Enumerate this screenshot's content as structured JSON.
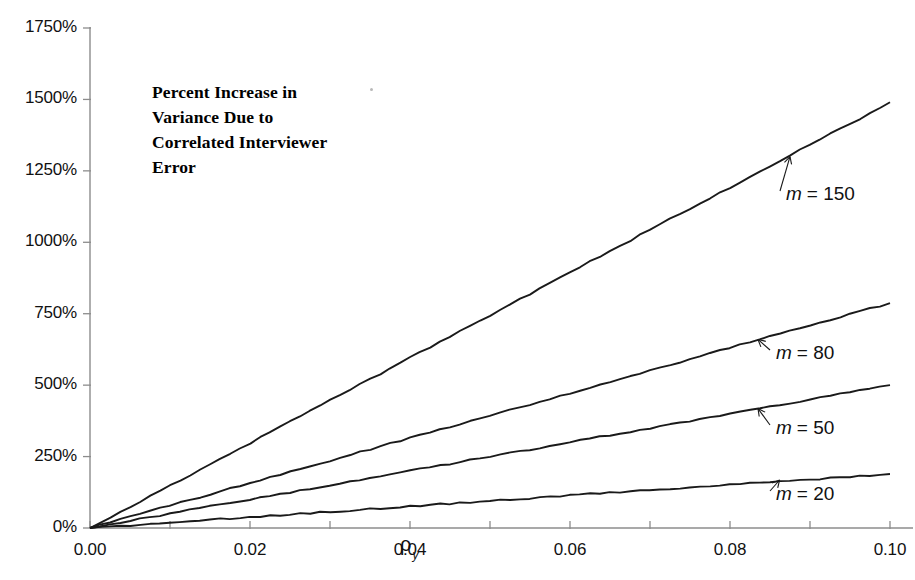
{
  "chart_data": {
    "type": "line",
    "title": "Percent Increase in\nVariance Due to\nCorrelated Interviewer\nError",
    "xlabel": "ρ",
    "xlabel_sub": "y",
    "ylabel": "",
    "xlim": [
      0.0,
      0.1
    ],
    "ylim": [
      0,
      1750
    ],
    "yunit": "%",
    "grid": false,
    "legend_position": "inline-annotations",
    "xticks": [
      0.0,
      0.01,
      0.02,
      0.03,
      0.04,
      0.05,
      0.06,
      0.07,
      0.08,
      0.09,
      0.1
    ],
    "xtick_labels": [
      "0.00",
      "",
      "0.02",
      "",
      "0.04",
      "",
      "0.06",
      "",
      "0.08",
      "",
      "0.10"
    ],
    "yticks": [
      0,
      250,
      500,
      750,
      1000,
      1250,
      1500,
      1750
    ],
    "ytick_labels": [
      "0%",
      "250%",
      "500%",
      "750%",
      "1000%",
      "1250%",
      "1500%",
      "1750%"
    ],
    "x": [
      0.0,
      0.01,
      0.02,
      0.03,
      0.04,
      0.05,
      0.06,
      0.07,
      0.08,
      0.09,
      0.1
    ],
    "series": [
      {
        "name": "m = 150",
        "m": 150,
        "label_math": "m",
        "label_value": "= 150",
        "color": "#1a1a1a",
        "values": [
          0,
          149,
          298,
          447,
          596,
          745,
          894,
          1043,
          1192,
          1341,
          1490
        ]
      },
      {
        "name": "m = 80",
        "m": 80,
        "label_math": "m",
        "label_value": "= 80",
        "color": "#1a1a1a",
        "values": [
          0,
          79,
          157,
          236,
          315,
          394,
          472,
          551,
          630,
          709,
          787
        ]
      },
      {
        "name": "m = 50",
        "m": 50,
        "label_math": "m",
        "label_value": "= 50",
        "color": "#1a1a1a",
        "values": [
          0,
          50,
          100,
          150,
          200,
          250,
          300,
          350,
          400,
          450,
          500
        ]
      },
      {
        "name": "m = 20",
        "m": 20,
        "label_math": "m",
        "label_value": "= 20",
        "color": "#1a1a1a",
        "values": [
          0,
          19,
          38,
          57,
          76,
          95,
          114,
          133,
          151,
          170,
          189
        ]
      }
    ],
    "annotations": [
      {
        "text": "m = 150",
        "series": 0,
        "arrow_to_x": 0.0875,
        "arrow_to_y": 1300
      },
      {
        "text": "m = 80",
        "series": 1,
        "arrow_to_x": 0.0835,
        "arrow_to_y": 660
      },
      {
        "text": "m = 50",
        "series": 2,
        "arrow_to_x": 0.0835,
        "arrow_to_y": 418
      },
      {
        "text": "m = 20",
        "series": 3,
        "arrow_to_x": 0.0862,
        "arrow_to_y": 168
      }
    ]
  },
  "axis_style": {
    "axis_color": "#8c8c8c",
    "tick_color": "#8c8c8c",
    "line_color": "#1a1a1a"
  }
}
